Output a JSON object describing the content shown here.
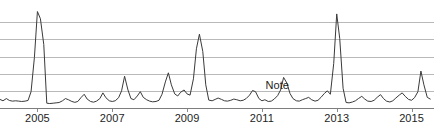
{
  "chart_data": {
    "type": "line",
    "title": "",
    "subtitle": "",
    "xlabel": "",
    "ylabel": "",
    "grid": true,
    "legend": false,
    "legend_position": "none",
    "line_color": "#3a3a3a",
    "grid_color": "#b9b9b9",
    "axis_color": "#7d7d7d",
    "background_color": "#ffffff",
    "xlim": [
      2004.0,
      2015.6
    ],
    "ylim": [
      0,
      6
    ],
    "x_tick_labels": [
      "2005",
      "2007",
      "2009",
      "2011",
      "2013",
      "2015"
    ],
    "x_tick_values": [
      2005,
      2007,
      2009,
      2011,
      2013,
      2015
    ],
    "y_gridline_values": [
      1,
      2,
      3,
      4,
      5
    ],
    "annotations": [
      {
        "text": "Note",
        "x": 2011.1,
        "y": 1.05
      }
    ],
    "series": [
      {
        "name": "value",
        "x": [
          2004.0,
          2004.08,
          2004.17,
          2004.25,
          2004.33,
          2004.42,
          2004.5,
          2004.58,
          2004.67,
          2004.75,
          2004.83,
          2004.92,
          2005.0,
          2005.08,
          2005.17,
          2005.25,
          2005.33,
          2005.42,
          2005.5,
          2005.58,
          2005.67,
          2005.75,
          2005.83,
          2005.92,
          2006.0,
          2006.08,
          2006.17,
          2006.25,
          2006.33,
          2006.42,
          2006.5,
          2006.58,
          2006.67,
          2006.75,
          2006.83,
          2006.92,
          2007.0,
          2007.08,
          2007.17,
          2007.25,
          2007.33,
          2007.42,
          2007.5,
          2007.58,
          2007.67,
          2007.75,
          2007.83,
          2007.92,
          2008.0,
          2008.08,
          2008.17,
          2008.25,
          2008.33,
          2008.42,
          2008.5,
          2008.58,
          2008.67,
          2008.75,
          2008.83,
          2008.92,
          2009.0,
          2009.08,
          2009.17,
          2009.25,
          2009.33,
          2009.42,
          2009.5,
          2009.58,
          2009.67,
          2009.75,
          2009.83,
          2009.92,
          2010.0,
          2010.08,
          2010.17,
          2010.25,
          2010.33,
          2010.42,
          2010.5,
          2010.58,
          2010.67,
          2010.75,
          2010.83,
          2010.92,
          2011.0,
          2011.08,
          2011.17,
          2011.25,
          2011.33,
          2011.42,
          2011.5,
          2011.58,
          2011.67,
          2011.75,
          2011.83,
          2011.92,
          2012.0,
          2012.08,
          2012.17,
          2012.25,
          2012.33,
          2012.42,
          2012.5,
          2012.58,
          2012.67,
          2012.75,
          2012.83,
          2012.92,
          2013.0,
          2013.08,
          2013.17,
          2013.25,
          2013.33,
          2013.42,
          2013.5,
          2013.58,
          2013.67,
          2013.75,
          2013.83,
          2013.92,
          2014.0,
          2014.08,
          2014.17,
          2014.25,
          2014.33,
          2014.42,
          2014.5,
          2014.58,
          2014.67,
          2014.75,
          2014.83,
          2014.92,
          2015.0,
          2015.08,
          2015.17,
          2015.25,
          2015.33,
          2015.42,
          2015.5
        ],
        "values": [
          0.5,
          0.42,
          0.55,
          0.44,
          0.4,
          0.42,
          0.4,
          0.38,
          0.4,
          0.44,
          0.95,
          2.95,
          5.62,
          5.2,
          3.7,
          0.28,
          0.26,
          0.28,
          0.3,
          0.32,
          0.42,
          0.55,
          0.48,
          0.38,
          0.33,
          0.38,
          0.62,
          0.8,
          0.52,
          0.38,
          0.34,
          0.4,
          0.55,
          0.88,
          0.6,
          0.42,
          0.38,
          0.42,
          0.6,
          1.0,
          1.85,
          1.05,
          0.55,
          0.48,
          0.7,
          0.95,
          0.62,
          0.48,
          0.4,
          0.36,
          0.38,
          0.45,
          0.8,
          1.52,
          2.05,
          1.35,
          0.82,
          0.7,
          0.92,
          1.05,
          0.82,
          0.75,
          1.7,
          3.45,
          4.3,
          3.3,
          1.35,
          0.46,
          0.42,
          0.5,
          0.58,
          0.5,
          0.42,
          0.4,
          0.45,
          0.52,
          0.48,
          0.42,
          0.45,
          0.55,
          0.75,
          1.02,
          0.95,
          0.55,
          0.42,
          0.48,
          0.38,
          0.4,
          0.52,
          0.72,
          1.05,
          1.78,
          1.45,
          0.85,
          0.55,
          0.42,
          0.4,
          0.48,
          0.55,
          0.62,
          0.48,
          0.4,
          0.45,
          0.62,
          0.85,
          1.0,
          0.8,
          2.6,
          5.48,
          4.05,
          1.15,
          0.32,
          0.3,
          0.35,
          0.42,
          0.55,
          0.68,
          0.52,
          0.4,
          0.38,
          0.45,
          0.62,
          0.78,
          0.55,
          0.4,
          0.35,
          0.42,
          0.58,
          0.75,
          0.88,
          0.68,
          0.5,
          0.45,
          0.6,
          0.95,
          2.15,
          1.35,
          0.62,
          0.52
        ]
      }
    ]
  },
  "annotation_labels": {
    "note": "Note"
  },
  "axis": {
    "tick_2005": "2005",
    "tick_2007": "2007",
    "tick_2009": "2009",
    "tick_2011": "2011",
    "tick_2013": "2013",
    "tick_2015": "2015"
  }
}
